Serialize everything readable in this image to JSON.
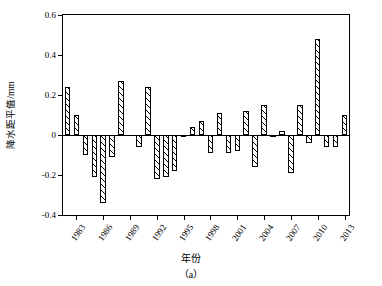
{
  "chart_data": {
    "type": "bar",
    "title": "",
    "panel_label": "（a）",
    "xlabel": "年份",
    "ylabel": "降水距平值/mm",
    "ylim": [
      -0.4,
      0.6
    ],
    "yticks": [
      -0.4,
      -0.2,
      0,
      0.2,
      0.4,
      0.6
    ],
    "ytick_labels": [
      "-0.4",
      "-0.2",
      "0",
      "0.2",
      "0.4",
      "0.6"
    ],
    "xticks": [
      1983,
      1986,
      1989,
      1992,
      1995,
      1998,
      2001,
      2004,
      2007,
      2010,
      2013
    ],
    "xtick_labels": [
      "1983",
      "1986",
      "1989",
      "1992",
      "1995",
      "1998",
      "2001",
      "2004",
      "2007",
      "2010",
      "2013"
    ],
    "grid": false,
    "legend": null,
    "bar_style": {
      "fill": "#ffffff",
      "edge": "#000000",
      "hatch": "diagonal"
    },
    "categories": [
      1982,
      1983,
      1984,
      1985,
      1986,
      1987,
      1988,
      1989,
      1990,
      1991,
      1992,
      1993,
      1994,
      1995,
      1996,
      1997,
      1998,
      1999,
      2000,
      2001,
      2002,
      2003,
      2004,
      2005,
      2006,
      2007,
      2008,
      2009,
      2010,
      2011,
      2012,
      2013
    ],
    "values": [
      0.24,
      0.1,
      -0.1,
      -0.21,
      -0.34,
      -0.11,
      0.27,
      0.0,
      -0.06,
      0.24,
      -0.22,
      -0.21,
      -0.18,
      -0.01,
      0.04,
      0.07,
      -0.09,
      0.11,
      -0.09,
      -0.08,
      0.12,
      -0.16,
      0.15,
      -0.01,
      0.02,
      -0.19,
      0.15,
      -0.04,
      0.48,
      -0.06,
      -0.06,
      0.1
    ]
  }
}
